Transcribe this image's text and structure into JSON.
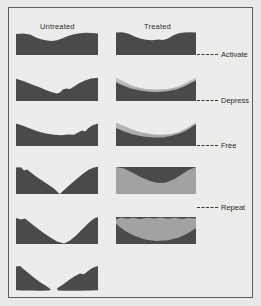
{
  "figure": {
    "background_color": "#ececeb",
    "border_color": "#5d5d5b",
    "material_dark_color": "#4a4a4a",
    "material_light_color": "#9d9d9d"
  },
  "columns": [
    {
      "id": "untreated",
      "label": "Untreated"
    },
    {
      "id": "treated",
      "label": "Treated"
    }
  ],
  "stage_labels": [
    {
      "id": "activate",
      "label": "Activate"
    },
    {
      "id": "depress",
      "label": "Depress"
    },
    {
      "id": "free",
      "label": "Free"
    },
    {
      "id": "repeat",
      "label": "Repeat"
    }
  ],
  "rows": [
    {
      "index": 1,
      "stage": "Activate",
      "untreated": {
        "dark_profile": "gentle wavy surface, shallow central dip",
        "light_layer": "none"
      },
      "treated": {
        "dark_profile": "gentle wavy surface, shallow central dip",
        "light_layer": "none"
      }
    },
    {
      "index": 2,
      "stage": "Depress",
      "untreated": {
        "dark_profile": "asymmetric V notch left of center",
        "light_layer": "none"
      },
      "treated": {
        "dark_profile": "broad smooth concave bowl",
        "light_layer": "thin light gradient cap over bowl"
      }
    },
    {
      "index": 3,
      "stage": "Free",
      "untreated": {
        "dark_profile": "irregular shallow concave, rough right shoulder",
        "light_layer": "none"
      },
      "treated": {
        "dark_profile": "smooth concave bowl",
        "light_layer": "light wedge filling upper bowl"
      }
    },
    {
      "index": 4,
      "stage": "(between Free and Repeat)",
      "untreated": {
        "dark_profile": "deep V reaching base, separating two walls",
        "light_layer": "none"
      },
      "treated": {
        "dark_profile": "deep wide bowl",
        "light_layer": "large light lens over bowl"
      }
    },
    {
      "index": 5,
      "stage": "Repeat",
      "untreated": {
        "dark_profile": "wide U bowl touching base at center",
        "light_layer": "none"
      },
      "treated": {
        "dark_profile": "shallow remnant base",
        "light_layer": "light region spanning full width"
      }
    },
    {
      "index": 6,
      "stage": "(fractured)",
      "untreated": {
        "dark_profile": "specimen fractured into two separate fragments",
        "light_layer": "none"
      },
      "treated": {
        "dark_profile": "none",
        "light_layer": "none"
      }
    }
  ]
}
